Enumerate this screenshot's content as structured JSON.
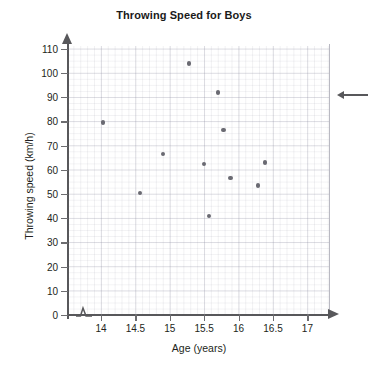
{
  "chart_data": {
    "type": "scatter",
    "title": "Throwing Speed for Boys",
    "xlabel": "Age (years)",
    "ylabel": "Throwing speed (km/h)",
    "xlim": [
      13.75,
      17.3
    ],
    "ylim": [
      0,
      113
    ],
    "xticks": [
      "14",
      "14.5",
      "15",
      "15.5",
      "16",
      "16.5",
      "17"
    ],
    "xtick_values": [
      14,
      14.5,
      15,
      15.5,
      16,
      16.5,
      17
    ],
    "yticks": [
      "0",
      "10",
      "20",
      "30",
      "40",
      "50",
      "60",
      "70",
      "80",
      "90",
      "100",
      "110"
    ],
    "ytick_values": [
      0,
      10,
      20,
      30,
      40,
      50,
      60,
      70,
      80,
      90,
      100,
      110
    ],
    "grid": true,
    "legend": null,
    "axis_break_x": true,
    "marker_color": "#6a6a72",
    "axis_color": "#58585b",
    "grid_color": "#c8c8d0",
    "points": [
      {
        "x": 14.03,
        "y": 79.5
      },
      {
        "x": 14.57,
        "y": 50.5
      },
      {
        "x": 14.9,
        "y": 66.5
      },
      {
        "x": 15.28,
        "y": 104.0
      },
      {
        "x": 15.5,
        "y": 62.5
      },
      {
        "x": 15.57,
        "y": 41.0
      },
      {
        "x": 15.7,
        "y": 92.0
      },
      {
        "x": 15.78,
        "y": 76.5
      },
      {
        "x": 15.88,
        "y": 56.5
      },
      {
        "x": 16.28,
        "y": 53.5
      },
      {
        "x": 16.38,
        "y": 63.0
      }
    ]
  },
  "annotation": {
    "arrow": "left-arrow-pointer"
  }
}
